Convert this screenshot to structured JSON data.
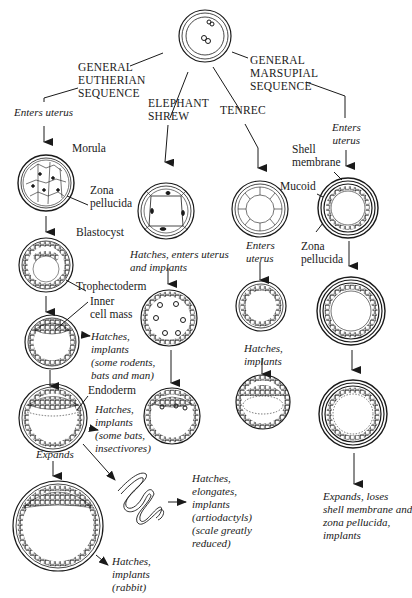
{
  "diagram": {
    "type": "embryo development sequence comparison",
    "root": {
      "name": "zygote-in-zona"
    },
    "sequences": [
      {
        "id": "eutherian",
        "title": [
          "GENERAL",
          "EUTHERIAN",
          "SEQUENCE"
        ],
        "enters_uterus": "Enters uterus",
        "stages": [
          {
            "label": "Morula",
            "annotation": [
              "Zona",
              "pellucida"
            ]
          },
          {
            "label": "Blastocyst",
            "annotation": [
              "Trophectoderm"
            ]
          },
          {
            "label": "Inner\ncell mass",
            "outcome": "Hatches,\nimplants\n(some rodents,\nbats and man)"
          },
          {
            "label": "Endoderm",
            "outcome": "Hatches,\nimplants\n(some bats,\ninsectivores)"
          },
          {
            "label": "Expands",
            "outcome": "Hatches,\nimplants\n(rabbit)"
          }
        ],
        "elongated_outcome": "Hatches,\nelongates,\nimplants\n(artiodactyls)\n(scale greatly\nreduced)"
      },
      {
        "id": "elephant-shrew",
        "title": [
          "ELEPHANT",
          "SHREW"
        ],
        "note": "Hatches, enters uterus\nand implants"
      },
      {
        "id": "tenrec",
        "title": [
          "TENREC"
        ],
        "enters_uterus": "Enters\nuterus",
        "note": "Hatches,\nimplants"
      },
      {
        "id": "marsupial",
        "title": [
          "GENERAL",
          "MARSUPIAL",
          "SEQUENCE"
        ],
        "enters_uterus": "Enters\nuterus",
        "annotations": {
          "shell": "Shell\nmembrane",
          "mucoid": "Mucoid",
          "zona": "Zona\npellucida"
        },
        "outcome": "Expands, loses\nshell membrane and\nzona pellucida,\nimplants"
      }
    ]
  },
  "labels": {
    "eu_title": "GENERAL\nEUTHERIAN\nSEQUENCE",
    "es_title": "ELEPHANT\nSHREW",
    "tenrec_title": "TENREC",
    "mars_title": "GENERAL\nMARSUPIAL\nSEQUENCE",
    "eu_enters": "Enters uterus",
    "morula": "Morula",
    "zona1": "Zona\npellucida",
    "blastocyst": "Blastocyst",
    "trophectoderm": "Trophectoderm",
    "inner_cell_mass": "Inner\ncell mass",
    "out_rodents": "Hatches,\nimplants\n(some rodents,\nbats and man)",
    "endoderm": "Endoderm",
    "out_bats": "Hatches,\nimplants\n(some bats,\ninsectivores)",
    "expands": "Expands",
    "out_artio": "Hatches,\nelongates,\nimplants\n(artiodactyls)\n(scale greatly\nreduced)",
    "out_rabbit": "Hatches,\nimplants\n(rabbit)",
    "es_note": "Hatches, enters uterus\nand implants",
    "tenrec_enters": "Enters\nuterus",
    "tenrec_note": "Hatches,\nimplants",
    "mars_enters": "Enters\nuterus",
    "shell_membrane": "Shell\nmembrane",
    "mucoid": "Mucoid",
    "zona2": "Zona\npellucida",
    "mars_outcome": "Expands, loses\nshell membrane and\nzona pellucida,\nimplants"
  }
}
